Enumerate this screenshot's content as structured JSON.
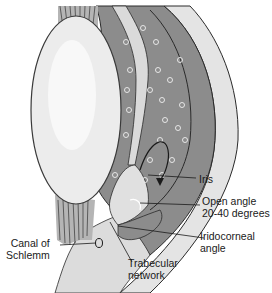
{
  "diagram": {
    "colors": {
      "background": "#ffffff",
      "lens": "#e8e8e8",
      "lens_outline": "#444444",
      "cornea_sclera": "#e2e2e2",
      "iris_body": "#8a8a8a",
      "tissue_light": "#d6d6d6",
      "outline": "#2a2a2a",
      "cells": "#d0d0d0"
    },
    "labels": [
      {
        "id": "iris",
        "text": "Iris"
      },
      {
        "id": "open-angle-line1",
        "text": "Open angle"
      },
      {
        "id": "open-angle-line2",
        "text": "20-40 degrees"
      },
      {
        "id": "iridocorneal-line1",
        "text": "Iridocorneal"
      },
      {
        "id": "iridocorneal-line2",
        "text": "angle"
      },
      {
        "id": "canal-line1",
        "text": "Canal of"
      },
      {
        "id": "canal-line2",
        "text": "Schlemm"
      },
      {
        "id": "trabecular-line1",
        "text": "Trabecular"
      },
      {
        "id": "trabecular-line2",
        "text": "network"
      }
    ]
  }
}
